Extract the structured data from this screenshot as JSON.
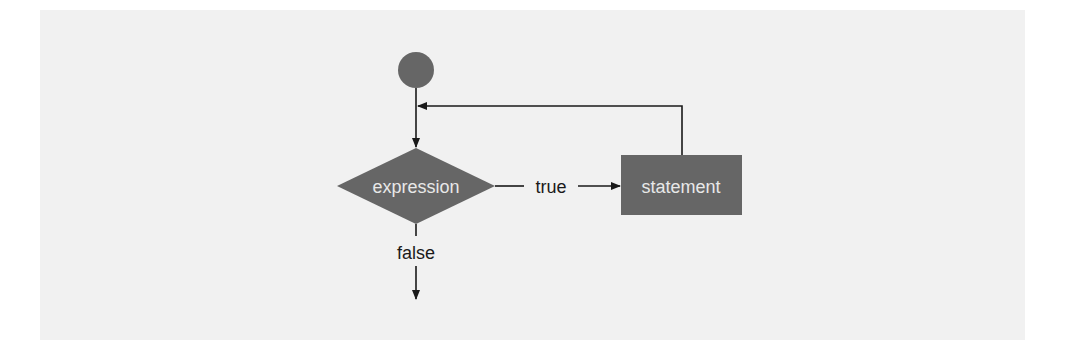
{
  "diagram": {
    "type": "flowchart",
    "nodes": {
      "start": {
        "shape": "circle",
        "label": ""
      },
      "decision": {
        "shape": "diamond",
        "label": "expression"
      },
      "action": {
        "shape": "rectangle",
        "label": "statement"
      }
    },
    "edges": {
      "true_label": "true",
      "false_label": "false"
    },
    "colors": {
      "background": "#f1f1f1",
      "node_fill": "#666666",
      "node_text": "#e8e8e8",
      "line": "#1a1a1a"
    }
  }
}
